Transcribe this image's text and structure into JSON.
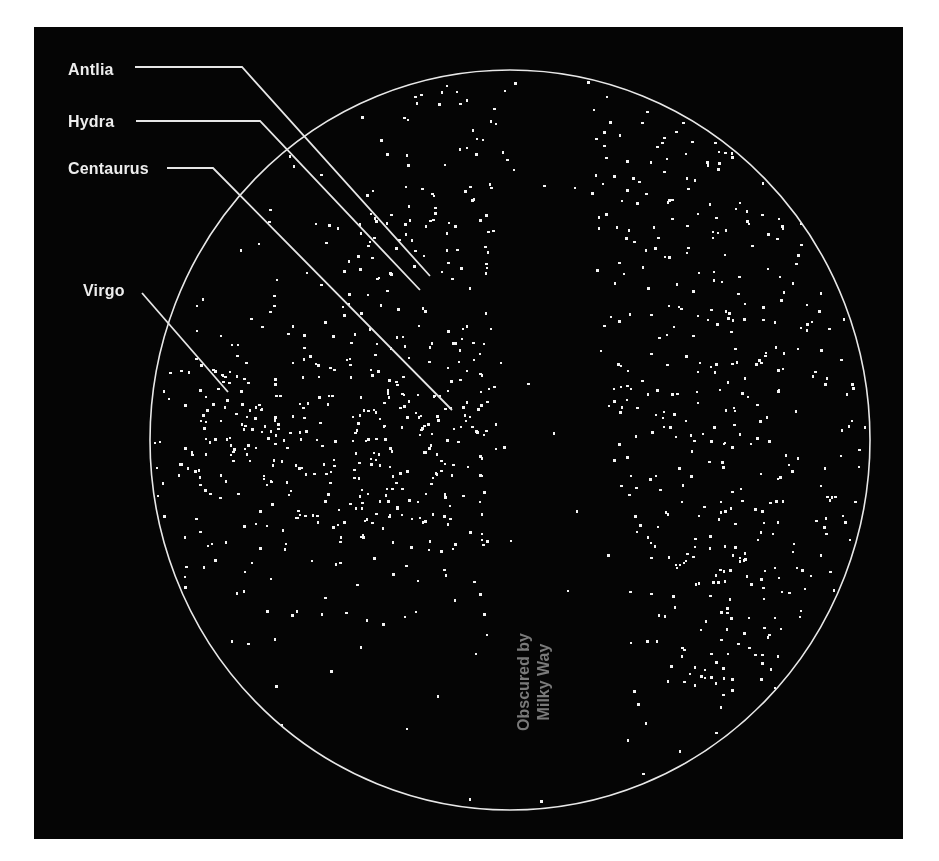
{
  "figure": {
    "background_color": "#050505",
    "page_color": "#ffffff",
    "dot_color": "#f4f4f4",
    "circle_color": "#e8e8e8",
    "annotation_color": "#7a7a7a"
  },
  "labels": [
    {
      "name": "Antlia",
      "text": "Antlia",
      "x": 68,
      "y": 62,
      "line": [
        [
          135,
          67
        ],
        [
          242,
          67
        ],
        [
          430,
          276
        ]
      ]
    },
    {
      "name": "Hydra",
      "text": "Hydra",
      "x": 68,
      "y": 114,
      "line": [
        [
          136,
          121
        ],
        [
          260,
          121
        ],
        [
          420,
          290
        ]
      ]
    },
    {
      "name": "Centaurus",
      "text": "Centaurus",
      "x": 68,
      "y": 161,
      "line": [
        [
          167,
          168
        ],
        [
          213,
          168
        ],
        [
          452,
          410
        ]
      ]
    },
    {
      "name": "Virgo",
      "text": "Virgo",
      "x": 83,
      "y": 283,
      "line": [
        [
          142,
          293
        ],
        [
          228,
          392
        ]
      ]
    }
  ],
  "annotation": {
    "line1": "Obscured by",
    "line2": "Milky Way"
  },
  "sky_circle": {
    "cx": 510,
    "cy": 440,
    "rx": 360,
    "ry": 370
  },
  "milky_way_band": {
    "center_x": 550,
    "top_half_width": 22,
    "bottom_half_width": 60
  }
}
